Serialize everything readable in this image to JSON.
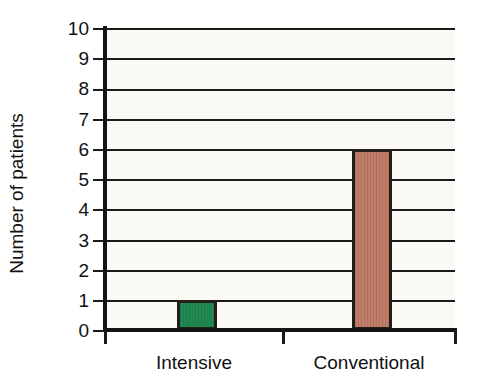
{
  "chart_data": {
    "type": "bar",
    "title": "",
    "subtitle": "",
    "xlabel": "",
    "ylabel": "Number of patients",
    "categories": [
      "Intensive",
      "Conventional"
    ],
    "values": [
      1,
      6
    ],
    "series": [
      {
        "name": "Number of patients",
        "values": [
          1,
          6
        ],
        "colors": [
          "#1d8a52",
          "#c07f6a"
        ]
      }
    ],
    "bar_colors": {
      "intensive": "#1d8a52",
      "conventional": "#c07f6a"
    },
    "ylim": [
      0,
      10
    ],
    "y_ticks": [
      "0",
      "1",
      "2",
      "3",
      "4",
      "5",
      "6",
      "7",
      "8",
      "9",
      "10"
    ],
    "y_tick_step": 1,
    "grid": true,
    "grid_axis": "y",
    "legend": false,
    "legend_position": "none",
    "plot_background": "#faf9f4",
    "axis_color": "#141414",
    "grid_color": "#1a1a17",
    "bar_border_color": "#231f18",
    "annotations": []
  },
  "axes": {
    "y_title": "Number of patients",
    "y_ticks": [
      {
        "label": "10",
        "value": 10
      },
      {
        "label": "9",
        "value": 9
      },
      {
        "label": "8",
        "value": 8
      },
      {
        "label": "7",
        "value": 7
      },
      {
        "label": "6",
        "value": 6
      },
      {
        "label": "5",
        "value": 5
      },
      {
        "label": "4",
        "value": 4
      },
      {
        "label": "3",
        "value": 3
      },
      {
        "label": "2",
        "value": 2
      },
      {
        "label": "1",
        "value": 1
      },
      {
        "label": "0",
        "value": 0
      }
    ],
    "x_categories": [
      {
        "label": "Intensive",
        "value": 1
      },
      {
        "label": "Conventional",
        "value": 6
      }
    ]
  }
}
